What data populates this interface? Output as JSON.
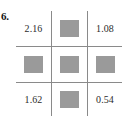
{
  "problem": {
    "number_label": "6.",
    "kind": "number-grid"
  },
  "colors": {
    "grid_outer_border": "#4a4a4a",
    "grid_inner_border": "#8a8a8a",
    "blank_square_fill": "#9a9a9a",
    "text": "#2b2b2b",
    "background": "#ffffff"
  },
  "grid": {
    "rows": 3,
    "columns": 3,
    "cells": [
      {
        "row": 0,
        "col": 0,
        "type": "value",
        "value": "2.16"
      },
      {
        "row": 0,
        "col": 1,
        "type": "blank",
        "value": ""
      },
      {
        "row": 0,
        "col": 2,
        "type": "value",
        "value": "1.08"
      },
      {
        "row": 1,
        "col": 0,
        "type": "blank",
        "value": ""
      },
      {
        "row": 1,
        "col": 1,
        "type": "blank",
        "value": ""
      },
      {
        "row": 1,
        "col": 2,
        "type": "blank",
        "value": ""
      },
      {
        "row": 2,
        "col": 0,
        "type": "value",
        "value": "1.62"
      },
      {
        "row": 2,
        "col": 1,
        "type": "blank",
        "value": ""
      },
      {
        "row": 2,
        "col": 2,
        "type": "value",
        "value": "0.54"
      }
    ]
  }
}
